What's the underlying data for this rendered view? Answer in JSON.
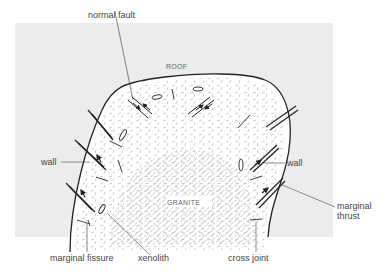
{
  "diagram": {
    "background_color": "#ececec",
    "labels": {
      "normal_fault": "normal fault",
      "roof": "ROOF",
      "wall_left": "wall",
      "wall_right": "wall",
      "granite": "GRANITE",
      "marginal_thrust_1": "marginal",
      "marginal_thrust_2": "thrust",
      "marginal_fissure": "marginal fissure",
      "xenolith": "xenolith",
      "cross_joint": "cross joint"
    }
  }
}
